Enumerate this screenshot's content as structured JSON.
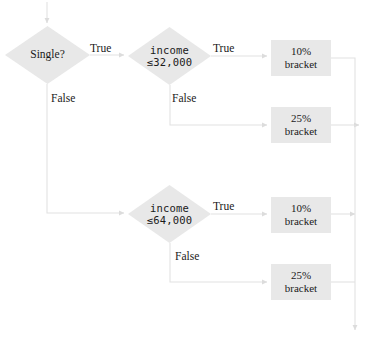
{
  "diagram": {
    "type": "flowchart",
    "canvas": {
      "width": 375,
      "height": 345
    },
    "colors": {
      "node_fill": "#e8e8e8",
      "edge_stroke": "#e2e2e2",
      "text": "#1a1a1a",
      "background": "#ffffff"
    },
    "nodes": [
      {
        "id": "single",
        "shape": "diamond",
        "label": "Single?",
        "text_style": "serif",
        "x": 5,
        "y": 26,
        "w": 85,
        "h": 58
      },
      {
        "id": "income32",
        "shape": "diamond",
        "label_line1": "income",
        "label_line2": "≤32,000",
        "text_style": "mono",
        "x": 128,
        "y": 27,
        "w": 83,
        "h": 58
      },
      {
        "id": "bracket10a",
        "shape": "rect",
        "label_line1": "10%",
        "label_line2": "bracket",
        "x": 271,
        "y": 40,
        "w": 60,
        "h": 36
      },
      {
        "id": "bracket25a",
        "shape": "rect",
        "label_line1": "25%",
        "label_line2": "bracket",
        "x": 271,
        "y": 107,
        "w": 60,
        "h": 36
      },
      {
        "id": "income64",
        "shape": "diamond",
        "label_line1": "income",
        "label_line2": "≤64,000",
        "text_style": "mono",
        "x": 128,
        "y": 185,
        "w": 83,
        "h": 58
      },
      {
        "id": "bracket10b",
        "shape": "rect",
        "label_line1": "10%",
        "label_line2": "bracket",
        "x": 271,
        "y": 197,
        "w": 60,
        "h": 36
      },
      {
        "id": "bracket25b",
        "shape": "rect",
        "label_line1": "25%",
        "label_line2": "bracket",
        "x": 271,
        "y": 264,
        "w": 60,
        "h": 36
      }
    ],
    "edge_labels": [
      {
        "id": "single-true",
        "text": "True",
        "x": 90,
        "y": 42
      },
      {
        "id": "single-false",
        "text": "False",
        "x": 51,
        "y": 92
      },
      {
        "id": "income32-true",
        "text": "True",
        "x": 213,
        "y": 42
      },
      {
        "id": "income32-false",
        "text": "False",
        "x": 172,
        "y": 92
      },
      {
        "id": "income64-true",
        "text": "True",
        "x": 213,
        "y": 200
      },
      {
        "id": "income64-false",
        "text": "False",
        "x": 175,
        "y": 250
      }
    ],
    "edges": [
      {
        "from": "entry",
        "to": "single",
        "label": ""
      },
      {
        "from": "single",
        "to": "income32",
        "label": "True"
      },
      {
        "from": "single",
        "to": "income64",
        "label": "False"
      },
      {
        "from": "income32",
        "to": "bracket10a",
        "label": "True"
      },
      {
        "from": "income32",
        "to": "bracket25a",
        "label": "False"
      },
      {
        "from": "income64",
        "to": "bracket10b",
        "label": "True"
      },
      {
        "from": "income64",
        "to": "bracket25b",
        "label": "False"
      },
      {
        "from": "bracket10a",
        "to": "exit",
        "label": ""
      },
      {
        "from": "bracket25a",
        "to": "exit",
        "label": ""
      },
      {
        "from": "bracket10b",
        "to": "exit",
        "label": ""
      },
      {
        "from": "bracket25b",
        "to": "exit",
        "label": ""
      }
    ]
  }
}
